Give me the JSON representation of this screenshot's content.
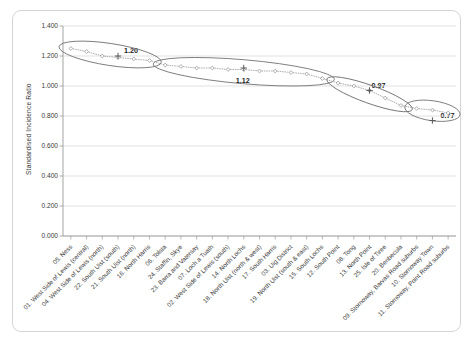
{
  "chart": {
    "type": "scatter",
    "y_axis_title": "Standardised Incidence Ratio",
    "x_axis_title": ""
  },
  "chart_data": {
    "type": "scatter",
    "title": "",
    "xlabel": "",
    "ylabel": "Standardised Incidence Ratio",
    "ylim": [
      0.0,
      1.4
    ],
    "grid": true,
    "legend": "none",
    "yticks": [
      "0.000",
      "0.200",
      "0.400",
      "0.600",
      "0.800",
      "1.000",
      "1.200",
      "1.400"
    ],
    "ytick_values": [
      0.0,
      0.2,
      0.4,
      0.6,
      0.8,
      1.0,
      1.2,
      1.4
    ],
    "categories": [
      "05. Ness",
      "01. West Side of Lewis (central)",
      "04. West Side of Lewis (north)",
      "22. South Uist (south)",
      "21. South Uist (north)",
      "16. North Harris",
      "06. Tolsta",
      "24. Staffin, Skye",
      "23. Barra and Vatersay",
      "07. Loch a Tuath",
      "02. West Side of Lewis (south)",
      "14. North Lochs",
      "18. North Uist (north & west)",
      "17. South Harris",
      "03. Uig District",
      "19. North Uist (south & east)",
      "15. South Lochs",
      "12. South Point",
      "08. Tong",
      "13. North Point",
      "25. Isle of Tiree",
      "20. Benbecula",
      "09. Stornoway, Barvas Road suburbs",
      "10. Stornoway Town",
      "11. Stornoway, Point Road suburbs"
    ],
    "values": [
      1.25,
      1.23,
      1.2,
      1.19,
      1.18,
      1.17,
      1.14,
      1.13,
      1.12,
      1.12,
      1.11,
      1.11,
      1.1,
      1.1,
      1.09,
      1.08,
      1.05,
      1.02,
      1.0,
      0.97,
      0.92,
      0.87,
      0.85,
      0.84,
      0.82
    ],
    "groups": [
      {
        "name": "group-1",
        "label": "1.20",
        "mean": 1.2,
        "start_index": 0,
        "end_index": 5,
        "member_values": [
          1.25,
          1.23,
          1.2,
          1.19,
          1.18,
          1.17
        ]
      },
      {
        "name": "group-2",
        "label": "1.12",
        "mean": 1.12,
        "start_index": 6,
        "end_index": 16,
        "member_values": [
          1.14,
          1.13,
          1.12,
          1.12,
          1.11,
          1.11,
          1.1,
          1.1,
          1.09,
          1.08,
          1.05
        ]
      },
      {
        "name": "group-3",
        "label": "0.97",
        "mean": 0.97,
        "start_index": 17,
        "end_index": 21,
        "member_values": [
          1.02,
          1.0,
          0.97,
          0.92,
          0.87
        ]
      },
      {
        "name": "group-4",
        "label": "0.77",
        "mean": 0.77,
        "start_index": 22,
        "end_index": 24,
        "member_values": [
          0.85,
          0.84,
          0.82
        ]
      }
    ],
    "group_mean_markers": [
      {
        "label": "1.20",
        "value": 1.2
      },
      {
        "label": "1.12",
        "value": 1.12
      },
      {
        "label": "0.97",
        "value": 0.97
      },
      {
        "label": "0.77",
        "value": 0.77
      }
    ],
    "colors": {
      "point": "#8c8c8c",
      "gridline": "#d9d9d9",
      "axis": "#9a9a9a",
      "marker": "#5a5a5a",
      "ellipse": "#6f6f6f",
      "text": "#3a3a3a"
    }
  }
}
